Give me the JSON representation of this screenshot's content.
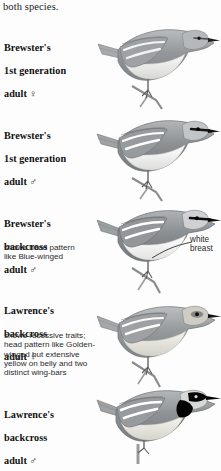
{
  "page": {
    "carryover_text": "both species.",
    "background": "#fdfdfd",
    "ink": "#1a1a1a"
  },
  "figures": [
    {
      "id": "brewsters-1st-generation-female",
      "label": "Brewster's\n1st generation\nadult ♀",
      "name_line1": "Brewster's",
      "name_line2": "1st generation",
      "name_line3": "adult ♀",
      "sex_symbol": "♀",
      "note": "",
      "plumage": "pale gray above, whitish below, two white wing-bars, thin dark eye-line",
      "colors": {
        "upper": "#9a9da0",
        "under": "#f2f2f0",
        "wingbar": "#ffffff",
        "eyeline": "#3a3a3a"
      }
    },
    {
      "id": "brewsters-1st-generation-male",
      "label": "Brewster's\n1st generation\nadult ♂",
      "name_line1": "Brewster's",
      "name_line2": "1st generation",
      "name_line3": "adult ♂",
      "sex_symbol": "♂",
      "note": "",
      "plumage": "gray above, white below, bold black eye-line, two white wing-bars",
      "colors": {
        "upper": "#8e9295",
        "under": "#f6f6f4",
        "wingbar": "#ffffff",
        "eyeline": "#1b1b1b"
      }
    },
    {
      "id": "brewsters-backcross-male",
      "label": "Brewster's\nbackcross\nadult ♂",
      "name_line1": "Brewster's",
      "name_line2": "backcross",
      "name_line3": "adult ♂",
      "sex_symbol": "♂",
      "note": "shows head pattern\nlike Blue-winged",
      "note_line1": "shows head pattern",
      "note_line2": "like Blue-winged",
      "plumage": "gray above, white breast, black eye-line, white wing-bars",
      "colors": {
        "upper": "#8b8f92",
        "under": "#fbfbfa",
        "wingbar": "#ffffff",
        "eyeline": "#161616"
      }
    },
    {
      "id": "lawrences-backcross-female",
      "label": "Lawrence's\nbackcross\nadult ♀",
      "name_line1": "Lawrence's",
      "name_line2": "backcross",
      "name_line3": "adult ♀",
      "sex_symbol": "♀",
      "note": "shows recessive traits;\nhead pattern like Golden-\nwinged but extensive\nyellow on belly and two\ndistinct wing-bars",
      "note_line1": "shows recessive traits;",
      "note_line2": "head pattern like Golden-",
      "note_line3": "winged but extensive",
      "note_line4": "yellow on belly and two",
      "note_line5": "distinct wing-bars",
      "plumage": "gray above, pale yellowish below, dusky eye patch, two wing-bars",
      "colors": {
        "upper": "#9b9ea0",
        "under": "#e9e7e0",
        "wingbar": "#ffffff",
        "eyeline": "#4a4a4a"
      }
    },
    {
      "id": "lawrences-backcross-male",
      "label": "Lawrence's\nbackcross\nadult ♂",
      "name_line1": "Lawrence's",
      "name_line2": "backcross",
      "name_line3": "adult ♂",
      "sex_symbol": "♂",
      "note": "",
      "plumage": "gray above, bold solid black throat and mask, two broad white wing-bars",
      "colors": {
        "upper": "#8f9295",
        "under": "#eceae4",
        "wingbar": "#ffffff",
        "eyeline": "#000000",
        "throat": "#0a0a0a"
      }
    }
  ],
  "callouts": [
    {
      "id": "white-breast",
      "line1": "white",
      "line2": "breast",
      "text": "white breast",
      "target_figure": "brewsters-backcross-male"
    }
  ]
}
